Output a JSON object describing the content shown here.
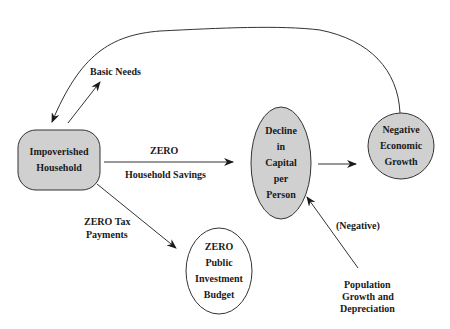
{
  "diagram": {
    "title": "",
    "colors": {
      "node_fill": "#d0d0d0",
      "node_fill_white": "#ffffff",
      "stroke": "#333333",
      "text": "#1a1a1a"
    },
    "nodes": {
      "household": {
        "lines": [
          "Impoverished",
          "Household"
        ],
        "shape": "rounded-rect",
        "filled": true
      },
      "decline": {
        "lines": [
          "Decline",
          "in",
          "Capital",
          "per",
          "Person"
        ],
        "shape": "ellipse",
        "filled": true
      },
      "growth": {
        "lines": [
          "Negative",
          "Economic",
          "Growth"
        ],
        "shape": "circle",
        "filled": true
      },
      "budget": {
        "lines": [
          "ZERO",
          "Public",
          "Investment",
          "Budget"
        ],
        "shape": "ellipse",
        "filled": false
      }
    },
    "labels": {
      "basic_needs": "Basic Needs",
      "zero": "ZERO",
      "household_savings": "Household Savings",
      "zero_tax_1": "ZERO Tax",
      "zero_tax_2": "Payments",
      "negative": "(Negative)",
      "population_1": "Population",
      "population_2": "Growth and",
      "population_3": "Depreciation"
    },
    "edges": [
      {
        "from": "household",
        "to": "basic_needs",
        "label": "Basic Needs"
      },
      {
        "from": "growth",
        "to": "household",
        "label": ""
      },
      {
        "from": "household",
        "to": "decline",
        "label": "ZERO Household Savings"
      },
      {
        "from": "decline",
        "to": "growth",
        "label": ""
      },
      {
        "from": "household",
        "to": "budget",
        "label": "ZERO Tax Payments"
      },
      {
        "from": "population",
        "to": "decline",
        "label": "(Negative)"
      }
    ]
  }
}
